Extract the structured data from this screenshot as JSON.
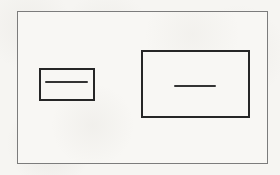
{
  "canvas": {
    "x": 0,
    "y": 0,
    "width": 280,
    "height": 175,
    "fill": "#f6f5f2"
  },
  "figure": {
    "outer_frame": {
      "x": 17,
      "y": 11,
      "width": 251,
      "height": 153,
      "border_width": 1,
      "border_color": "#7c7c7c",
      "fill": "#f8f7f4"
    },
    "small_box": {
      "x": 39,
      "y": 68,
      "width": 56,
      "height": 33,
      "border_width": 2,
      "border_color": "#262626",
      "fill": "#f8f7f4"
    },
    "small_box_dash": {
      "x": 45,
      "y": 81,
      "width": 43,
      "height": 2,
      "fill": "#343434"
    },
    "large_box": {
      "x": 141,
      "y": 50,
      "width": 109,
      "height": 68,
      "border_width": 2,
      "border_color": "#262626",
      "fill": "#f8f7f4"
    },
    "large_box_dash": {
      "x": 174,
      "y": 85,
      "width": 42,
      "height": 2,
      "fill": "#343434"
    }
  }
}
